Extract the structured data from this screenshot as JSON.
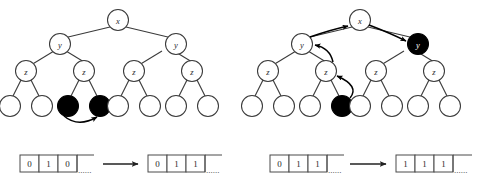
{
  "figure": {
    "colors": {
      "node_fill": "#ffffff",
      "node_fill_marked": "#000000",
      "stroke": "#3a3a3a",
      "arrow": "#000000",
      "background": "#ffffff"
    }
  },
  "panels": [
    {
      "id": "left",
      "name": "before",
      "tree": {
        "levels": [
          {
            "level": 0,
            "nodes": [
              {
                "id": "L-x",
                "label": "x",
                "marked": false
              }
            ]
          },
          {
            "level": 1,
            "nodes": [
              {
                "id": "L-y1",
                "label": "y",
                "marked": false
              },
              {
                "id": "L-y2",
                "label": "y",
                "marked": false
              }
            ]
          },
          {
            "level": 2,
            "nodes": [
              {
                "id": "L-z1",
                "label": "z",
                "marked": false
              },
              {
                "id": "L-z2",
                "label": "z",
                "marked": false
              },
              {
                "id": "L-z3",
                "label": "z",
                "marked": false
              },
              {
                "id": "L-z4",
                "label": "z",
                "marked": false
              }
            ]
          },
          {
            "level": 3,
            "nodes": [
              {
                "id": "L-l1",
                "label": "",
                "marked": false
              },
              {
                "id": "L-l2",
                "label": "",
                "marked": false
              },
              {
                "id": "L-l3",
                "label": "",
                "marked": true
              },
              {
                "id": "L-l4",
                "label": "",
                "marked": true
              },
              {
                "id": "L-l5",
                "label": "",
                "marked": false
              },
              {
                "id": "L-l6",
                "label": "",
                "marked": false
              },
              {
                "id": "L-l7",
                "label": "",
                "marked": false
              },
              {
                "id": "L-l8",
                "label": "",
                "marked": false
              }
            ]
          }
        ],
        "pointers": [
          {
            "from": "L-l3",
            "to": "L-l4"
          }
        ]
      },
      "arrays": {
        "before": {
          "cells": [
            "0",
            "1",
            "0"
          ],
          "ellipsis": "......"
        },
        "after": {
          "cells": [
            "0",
            "1",
            "1"
          ],
          "ellipsis": "......"
        },
        "transition": "arrow-right"
      }
    },
    {
      "id": "right",
      "name": "after",
      "tree": {
        "levels": [
          {
            "level": 0,
            "nodes": [
              {
                "id": "R-x",
                "label": "x",
                "marked": false
              }
            ]
          },
          {
            "level": 1,
            "nodes": [
              {
                "id": "R-y1",
                "label": "y",
                "marked": false
              },
              {
                "id": "R-y2",
                "label": "y",
                "marked": true
              }
            ]
          },
          {
            "level": 2,
            "nodes": [
              {
                "id": "R-z1",
                "label": "z",
                "marked": false
              },
              {
                "id": "R-z2",
                "label": "z",
                "marked": false
              },
              {
                "id": "R-z3",
                "label": "z",
                "marked": false
              },
              {
                "id": "R-z4",
                "label": "z",
                "marked": false
              }
            ]
          },
          {
            "level": 3,
            "nodes": [
              {
                "id": "R-l1",
                "label": "",
                "marked": false
              },
              {
                "id": "R-l2",
                "label": "",
                "marked": false
              },
              {
                "id": "R-l3",
                "label": "",
                "marked": false
              },
              {
                "id": "R-l4",
                "label": "",
                "marked": true
              },
              {
                "id": "R-l5",
                "label": "",
                "marked": false
              },
              {
                "id": "R-l6",
                "label": "",
                "marked": false
              },
              {
                "id": "R-l7",
                "label": "",
                "marked": false
              },
              {
                "id": "R-l8",
                "label": "",
                "marked": false
              }
            ]
          }
        ],
        "pointers": [
          {
            "from": "R-l4",
            "to": "R-z2"
          },
          {
            "from": "R-z2",
            "to": "R-y1"
          },
          {
            "from": "R-y1",
            "to": "R-x"
          },
          {
            "from": "R-x",
            "to": "R-y2"
          }
        ]
      },
      "arrays": {
        "before": {
          "cells": [
            "0",
            "1",
            "1"
          ],
          "ellipsis": "......"
        },
        "after": {
          "cells": [
            "1",
            "1",
            "1"
          ],
          "ellipsis": "......"
        },
        "transition": "arrow-right"
      }
    }
  ]
}
